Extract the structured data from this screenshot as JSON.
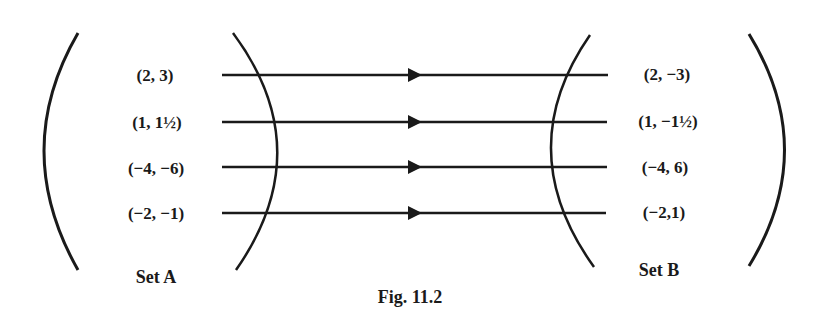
{
  "diagram": {
    "type": "mapping",
    "caption": "Fig. 11.2",
    "set_a": {
      "title": "Set A",
      "elements": [
        "(2, 3)",
        "(1, 1½)",
        "(−4, −6)",
        "(−2, −1)"
      ]
    },
    "set_b": {
      "title": "Set B",
      "elements": [
        "(2, −3)",
        "(1, −1½)",
        "(−4, 6)",
        "(−2,1)"
      ]
    },
    "mappings": [
      {
        "from": "(2, 3)",
        "to": "(2, −3)"
      },
      {
        "from": "(1, 1½)",
        "to": "(1, −1½)"
      },
      {
        "from": "(−4, −6)",
        "to": "(−4, 6)"
      },
      {
        "from": "(−2, −1)",
        "to": "(−2,1)"
      }
    ],
    "colors": {
      "ink": "#1a1a1a",
      "background": "#ffffff"
    }
  }
}
